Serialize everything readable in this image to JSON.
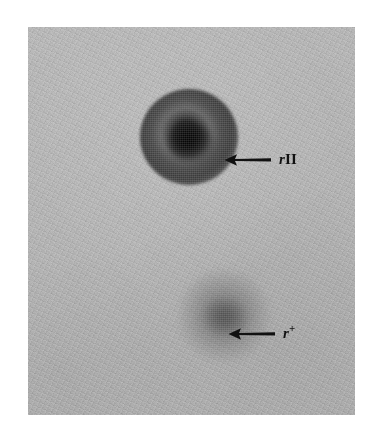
{
  "figure": {
    "type": "photograph",
    "background_color": "#ffffff",
    "plate": {
      "base_color": "#c6c6c6",
      "texture": "halftone-grain"
    }
  },
  "annotations": [
    {
      "id": "rii",
      "arrow_icon": "arrow-left-icon",
      "arrow_direction": "left",
      "arrow_color": "#111111",
      "gene": "r",
      "allele": "II",
      "allele_style": "roman",
      "label_text": "rII"
    },
    {
      "id": "rplus",
      "arrow_icon": "arrow-left-icon",
      "arrow_direction": "left",
      "arrow_color": "#111111",
      "gene": "r",
      "allele": "+",
      "allele_style": "superscript",
      "label_text": "r+"
    }
  ],
  "plaques": [
    {
      "id": "rii",
      "label": "rII",
      "appearance": "large dark plaque with sharp border and darker centre",
      "relative_size": "large",
      "darkness": "dark"
    },
    {
      "id": "rplus",
      "label": "r+",
      "appearance": "smaller diffuse grey plaque with fuzzy halo border",
      "relative_size": "small",
      "darkness": "light"
    }
  ]
}
